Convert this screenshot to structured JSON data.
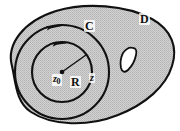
{
  "figure": {
    "type": "complex-analysis-contour-diagram",
    "background_color": "#ffffff",
    "region_fill_color": "#c8c8c8",
    "stroke_color": "#111111",
    "hole_fill_color": "#ffffff"
  },
  "labels": {
    "domain_outer": "D",
    "contour": "C",
    "center_point": "z",
    "center_point_subscript": "0",
    "radius": "R",
    "boundary_point": "z"
  },
  "elements": {
    "outer_region_name": "domain-D-shaded-region",
    "hole_name": "domain-hole-puncture",
    "contour_name": "contour-C-circle",
    "inner_circle_name": "inner-circle-radius-R",
    "radius_segment_name": "radius-segment",
    "center_dot_name": "center-point-dot",
    "arrow_contour_name": "contour-C-direction-arrow",
    "arrow_inner_name": "inner-circle-direction-arrow"
  },
  "geometry": {
    "center_x": 62,
    "center_y": 72,
    "inner_radius_px": 30,
    "contour_radius_px": 47,
    "orientation": "counterclockwise"
  }
}
